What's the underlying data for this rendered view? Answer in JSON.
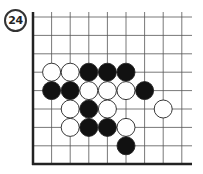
{
  "problem": {
    "number": "24"
  },
  "board": {
    "origin_x": 33,
    "origin_y": 17,
    "spacing_x": 18.6,
    "spacing_y": 18.4,
    "cols": 9,
    "rows": 9,
    "right_extent": 192,
    "bottom_edge": 164,
    "top_extent": 12,
    "stone_radius": 9,
    "colors": {
      "line": "#555555",
      "edge": "#222222",
      "black": "#111111",
      "white": "#ffffff",
      "stone_outline": "#222222"
    },
    "stones": [
      {
        "col": 1,
        "row": 3,
        "color": "white"
      },
      {
        "col": 2,
        "row": 3,
        "color": "white"
      },
      {
        "col": 3,
        "row": 3,
        "color": "black"
      },
      {
        "col": 4,
        "row": 3,
        "color": "black"
      },
      {
        "col": 5,
        "row": 3,
        "color": "black"
      },
      {
        "col": 1,
        "row": 4,
        "color": "black"
      },
      {
        "col": 2,
        "row": 4,
        "color": "black"
      },
      {
        "col": 3,
        "row": 4,
        "color": "white"
      },
      {
        "col": 4,
        "row": 4,
        "color": "white"
      },
      {
        "col": 5,
        "row": 4,
        "color": "white"
      },
      {
        "col": 6,
        "row": 4,
        "color": "black"
      },
      {
        "col": 2,
        "row": 5,
        "color": "white"
      },
      {
        "col": 3,
        "row": 5,
        "color": "black"
      },
      {
        "col": 4,
        "row": 5,
        "color": "white"
      },
      {
        "col": 7,
        "row": 5,
        "color": "white"
      },
      {
        "col": 2,
        "row": 6,
        "color": "white"
      },
      {
        "col": 3,
        "row": 6,
        "color": "black"
      },
      {
        "col": 4,
        "row": 6,
        "color": "black"
      },
      {
        "col": 5,
        "row": 6,
        "color": "white"
      },
      {
        "col": 5,
        "row": 7,
        "color": "black"
      }
    ]
  }
}
